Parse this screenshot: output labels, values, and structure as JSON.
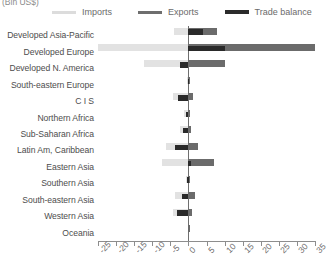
{
  "units_caption": "(Bln US$)",
  "legend": {
    "items": [
      {
        "label": "Imports",
        "key": "imports",
        "color": "#e2e2e2"
      },
      {
        "label": "Exports",
        "key": "exports",
        "color": "#6b6b6b"
      },
      {
        "label": "Trade balance",
        "key": "balance",
        "color": "#2a2a2a"
      }
    ]
  },
  "chart_data": {
    "type": "bar",
    "orientation": "horizontal",
    "title": "",
    "subtitle": "(Bln US$)",
    "xlabel": "",
    "ylabel": "",
    "xlim": [
      -25,
      35
    ],
    "grid": false,
    "legend_position": "top",
    "xticks": [
      -25,
      -20,
      -15,
      -10,
      -5,
      0,
      5,
      10,
      15,
      20,
      25,
      30,
      35
    ],
    "xticklabels": [
      "-25",
      "-20",
      "-15",
      "-10",
      "-5",
      "0",
      "5",
      "10",
      "15",
      "20",
      "25",
      "30",
      "35"
    ],
    "categories": [
      "Developed Asia-Pacific",
      "Developed Europe",
      "Developed N. America",
      "South-eastern Europe",
      "C I S",
      "Northern Africa",
      "Sub-Saharan Africa",
      "Latin Am, Caribbean",
      "Eastern Asia",
      "Southern Asia",
      "South-eastern Asia",
      "Western Asia",
      "Oceania"
    ],
    "series": [
      {
        "name": "Imports",
        "color": "#e2e2e2",
        "values": [
          -4.0,
          -25.0,
          -12.4,
          -0.4,
          -4.2,
          -1.3,
          -2.2,
          -6.3,
          -7.3,
          -0.8,
          -3.6,
          -4.2,
          -0.2
        ]
      },
      {
        "name": "Exports",
        "color": "#6b6b6b",
        "values": [
          7.9,
          35.0,
          10.2,
          0.5,
          1.2,
          0.5,
          0.6,
          2.6,
          7.2,
          0.5,
          1.8,
          1.1,
          0.2
        ]
      },
      {
        "name": "Trade balance",
        "color": "#2a2a2a",
        "values": [
          3.9,
          10.0,
          -2.2,
          -0.1,
          -3.0,
          -0.8,
          -1.6,
          -3.7,
          0.6,
          -0.3,
          -1.8,
          -3.1,
          0.0
        ]
      }
    ]
  }
}
